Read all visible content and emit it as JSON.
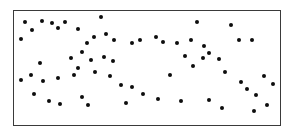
{
  "figure": {
    "width": 292,
    "height": 136,
    "background_color": "#ffffff"
  },
  "frame": {
    "x": 13,
    "y": 10,
    "width": 268,
    "height": 116,
    "border_color": "#3a3a3a",
    "border_width": 1,
    "fill_color": "#ffffff"
  },
  "chart_data": {
    "type": "scatter",
    "title": "",
    "subtitle": "",
    "xlabel": "",
    "ylabel": "",
    "xlim": [
      0,
      268
    ],
    "ylim": [
      0,
      116
    ],
    "grid": false,
    "legend": null,
    "axis_ticks": false,
    "axis_tick_labels": [],
    "annotations": [],
    "marker": {
      "shape": "circle",
      "color": "#0d0d0d",
      "size_px": 4
    },
    "point_count": 65,
    "series": [
      {
        "name": "points",
        "color": "#0d0d0d",
        "points": [
          [
            11,
            11
          ],
          [
            18,
            19
          ],
          [
            28,
            10
          ],
          [
            38,
            12
          ],
          [
            44,
            17
          ],
          [
            51,
            11
          ],
          [
            7,
            28
          ],
          [
            88,
            6
          ],
          [
            64,
            18
          ],
          [
            81,
            26
          ],
          [
            93,
            23
          ],
          [
            74,
            33
          ],
          [
            101,
            30
          ],
          [
            119,
            33
          ],
          [
            127,
            29
          ],
          [
            143,
            26
          ],
          [
            150,
            32
          ],
          [
            164,
            33
          ],
          [
            184,
            11
          ],
          [
            178,
            29
          ],
          [
            191,
            36
          ],
          [
            219,
            14
          ],
          [
            227,
            29
          ],
          [
            240,
            29
          ],
          [
            57,
            48
          ],
          [
            69,
            42
          ],
          [
            78,
            50
          ],
          [
            64,
            58
          ],
          [
            82,
            62
          ],
          [
            26,
            53
          ],
          [
            17,
            65
          ],
          [
            44,
            68
          ],
          [
            7,
            70
          ],
          [
            29,
            71
          ],
          [
            91,
            47
          ],
          [
            100,
            51
          ],
          [
            172,
            46
          ],
          [
            180,
            56
          ],
          [
            190,
            48
          ],
          [
            196,
            43
          ],
          [
            207,
            49
          ],
          [
            157,
            65
          ],
          [
            213,
            62
          ],
          [
            97,
            66
          ],
          [
            60,
            65
          ],
          [
            108,
            75
          ],
          [
            119,
            77
          ],
          [
            20,
            84
          ],
          [
            130,
            84
          ],
          [
            145,
            90
          ],
          [
            35,
            92
          ],
          [
            46,
            95
          ],
          [
            69,
            88
          ],
          [
            75,
            96
          ],
          [
            113,
            94
          ],
          [
            168,
            92
          ],
          [
            196,
            91
          ],
          [
            229,
            72
          ],
          [
            235,
            79
          ],
          [
            244,
            85
          ],
          [
            252,
            66
          ],
          [
            261,
            74
          ],
          [
            255,
            96
          ],
          [
            242,
            102
          ],
          [
            210,
            99
          ]
        ]
      }
    ]
  }
}
